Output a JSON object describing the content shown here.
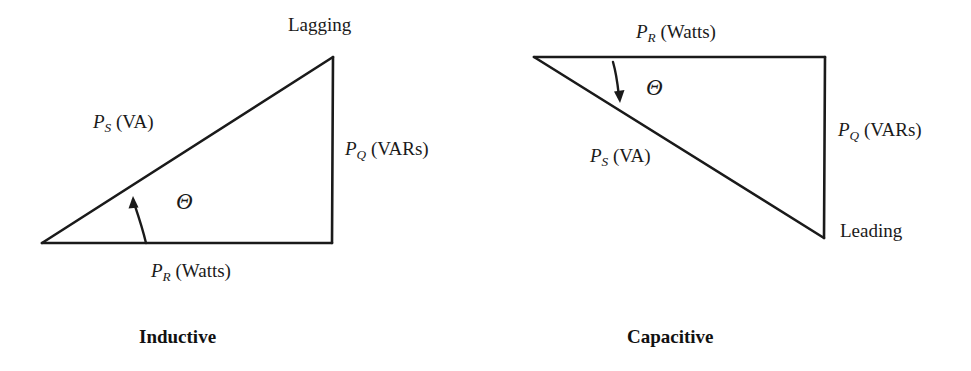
{
  "figure": {
    "background_color": "#ffffff",
    "stroke_color": "#1a1a1a"
  },
  "diagrams": [
    {
      "id": "inductive",
      "caption": "Inductive",
      "corner_label": "Lagging",
      "angle_symbol": "Θ",
      "hypotenuse_label": {
        "symbol": "P",
        "subscript": "S",
        "unit": "(VA)"
      },
      "vertical_label": {
        "symbol": "P",
        "subscript": "Q",
        "unit": "(VARs)"
      },
      "horizontal_label": {
        "symbol": "P",
        "subscript": "R",
        "unit": "(Watts)"
      },
      "geometry": {
        "left_vertex": [
          42,
          243
        ],
        "top_vertex": [
          333,
          57
        ],
        "right_vertex": [
          332,
          243
        ]
      }
    },
    {
      "id": "capacitive",
      "caption": "Capacitive",
      "corner_label": "Leading",
      "angle_symbol": "Θ",
      "hypotenuse_label": {
        "symbol": "P",
        "subscript": "S",
        "unit": "(VA)"
      },
      "vertical_label": {
        "symbol": "P",
        "subscript": "Q",
        "unit": "(VARs)"
      },
      "horizontal_label": {
        "symbol": "P",
        "subscript": "R",
        "unit": "(Watts)"
      },
      "geometry": {
        "left_vertex": [
          534,
          57
        ],
        "top_right_vertex": [
          825,
          57
        ],
        "bottom_right_vertex": [
          824,
          238
        ]
      }
    }
  ]
}
